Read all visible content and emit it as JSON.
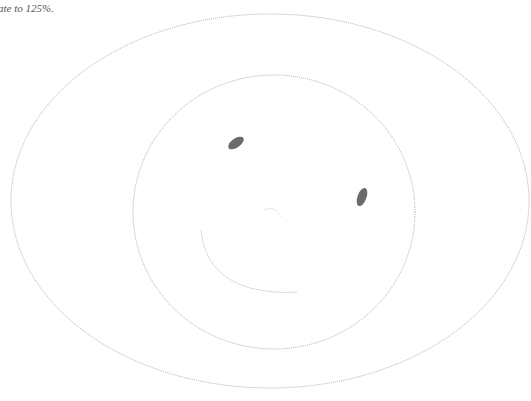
{
  "caption": "ate to 125%.",
  "drawing": {
    "outer_ellipse": {
      "cx": 270,
      "cy": 201,
      "rx": 259,
      "ry": 187
    },
    "face": {
      "cx": 274,
      "cy": 212,
      "rx": 141,
      "ry": 137
    },
    "left_eye": {
      "cx": 236,
      "cy": 143,
      "rx": 5,
      "ry": 9,
      "rotate": 55
    },
    "right_eye": {
      "cx": 362,
      "cy": 197,
      "rx": 4.5,
      "ry": 9.5,
      "rotate": 20
    },
    "colors": {
      "stroke": "#999999",
      "eye": "#6b6b6b",
      "mouth": "#d8d8d8"
    }
  }
}
